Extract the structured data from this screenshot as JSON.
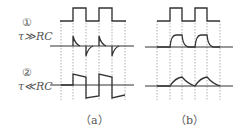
{
  "labels": {
    "case1_marker": "①",
    "case1_condition": "τ≫RC",
    "case2_marker": "②",
    "case2_condition": "τ≪RC",
    "caption_a": "（a）",
    "caption_b": "（b）"
  },
  "colors": {
    "waveform": "#333333",
    "dashed": "#9a9a9a",
    "text": "#555555"
  },
  "panels": [
    {
      "id": "a",
      "description": "Input square wave; case 1 differentiator spikes; case 2 coupled square wave with droop"
    },
    {
      "id": "b",
      "description": "Input square wave; case 1 integrated (rounded) pulses; case 2 triangular-like humps"
    }
  ]
}
